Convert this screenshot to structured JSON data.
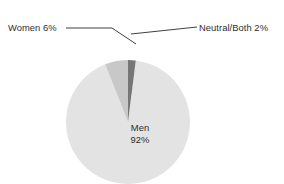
{
  "chart_data": {
    "type": "pie",
    "title": "",
    "subtitle": "",
    "xlabel": "",
    "ylabel": "",
    "legend_position": "none",
    "grid": false,
    "units": "percent",
    "start_angle_deg": 0,
    "direction": "clockwise",
    "categories": [
      "Men",
      "Women",
      "Neutral/Both"
    ],
    "values": [
      92,
      6,
      2
    ],
    "labels": [
      "Men 92%",
      "Women 6%",
      "Neutral/Both 2%"
    ],
    "slices": [
      {
        "name": "Men",
        "value": 92,
        "value_text": "92%",
        "label_text": "Men",
        "color": "#e3e3e3",
        "angle_deg": 331.2,
        "label_placement": "inside"
      },
      {
        "name": "Women",
        "value": 6,
        "value_text": "6%",
        "label_text": "Women 6%",
        "color": "#c8c8c8",
        "angle_deg": 21.6,
        "label_placement": "callout-left"
      },
      {
        "name": "Neutral/Both",
        "value": 2,
        "value_text": "2%",
        "label_text": "Neutral/Both 2%",
        "color": "#767676",
        "angle_deg": 7.2,
        "label_placement": "callout-right"
      }
    ]
  },
  "title": {
    "text": ""
  },
  "callouts": {
    "women": "Women 6%",
    "neutral": "Neutral/Both 2%"
  },
  "inner_label": {
    "men_name": "Men",
    "men_value": "92%"
  },
  "colors": {
    "background": "#ffffff",
    "men_slice": "#e3e3e3",
    "women_slice": "#c8c8c8",
    "neutral_slice": "#767676",
    "text": "#2e2e2e",
    "leader_line": "#3f3f3f"
  }
}
